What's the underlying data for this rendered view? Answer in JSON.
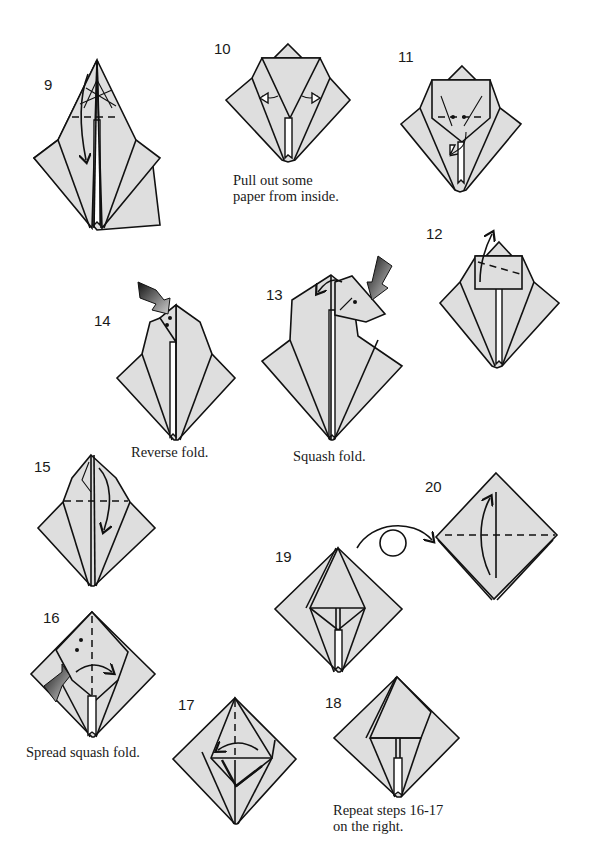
{
  "page": {
    "background": "#ffffff",
    "paper_color": "#dedede",
    "line_color": "#111111"
  },
  "steps": [
    {
      "number": "9",
      "caption": "",
      "symbols": [
        "valley-fold-line",
        "fold-down-arrow",
        "crease-lines"
      ]
    },
    {
      "number": "10",
      "caption_lines": [
        "Pull out some",
        "paper from inside."
      ],
      "symbols": [
        "pull-out-arrow-left",
        "pull-out-arrow-right"
      ]
    },
    {
      "number": "11",
      "caption": "",
      "symbols": [
        "valley-fold-line",
        "dots",
        "tuck-arrow"
      ]
    },
    {
      "number": "12",
      "caption": "",
      "symbols": [
        "valley-fold-line",
        "fold-up-arrow"
      ]
    },
    {
      "number": "13",
      "caption": "Squash fold.",
      "symbols": [
        "push-arrow",
        "fold-left-arrow",
        "dot"
      ]
    },
    {
      "number": "14",
      "caption": "Reverse fold.",
      "symbols": [
        "push-arrow",
        "dots"
      ]
    },
    {
      "number": "15",
      "caption": "",
      "symbols": [
        "valley-fold-line",
        "fold-down-arrow"
      ]
    },
    {
      "number": "16",
      "caption": "Spread squash fold.",
      "symbols": [
        "push-arrow",
        "valley-fold-line",
        "dots",
        "fold-right-arrow"
      ]
    },
    {
      "number": "17",
      "caption": "",
      "symbols": [
        "valley-fold-line",
        "fold-left-arrow"
      ]
    },
    {
      "number": "18",
      "caption_lines": [
        "Repeat steps 16-17",
        "on the right."
      ],
      "symbols": []
    },
    {
      "number": "19",
      "caption": "",
      "symbols": [
        "turn-over-arrow"
      ]
    },
    {
      "number": "20",
      "caption": "",
      "symbols": [
        "valley-fold-line",
        "fold-up-arrow"
      ]
    }
  ]
}
